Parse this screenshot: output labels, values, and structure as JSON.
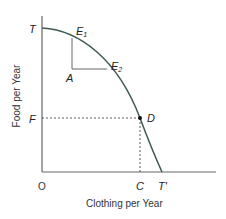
{
  "diagram": {
    "type": "production-possibilities-frontier",
    "x_axis_title": "Clothing per Year",
    "y_axis_title": "Food per Year",
    "origin_label": "O",
    "points": {
      "T": "T",
      "T_prime": "T'",
      "E1": "E",
      "E1_sub": "1",
      "E2": "E",
      "E2_sub": "2",
      "A": "A",
      "D": "D",
      "F": "F",
      "C": "C"
    },
    "colors": {
      "curve": "#3d5a52",
      "axes": "#555555",
      "dashed": "#333333",
      "text": "#222222"
    }
  }
}
